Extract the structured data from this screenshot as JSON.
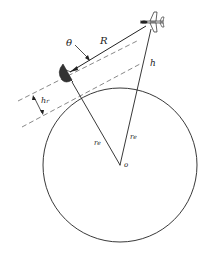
{
  "diagram": {
    "type": "geometry",
    "labels": {
      "theta": "θ",
      "range": "R",
      "height": "h",
      "radar_height_main": "h",
      "radar_height_sub": "r",
      "earth_radius_left_main": "r",
      "earth_radius_left_sub": "e",
      "earth_radius_right_main": "r",
      "earth_radius_right_sub": "e",
      "center": "o"
    },
    "elements": {
      "earth_circle": {
        "cx": 120,
        "cy": 165,
        "r": 76
      },
      "radar_dish": {
        "x": 66,
        "y": 74
      },
      "aircraft": {
        "x": 152,
        "y": 22
      }
    },
    "colors": {
      "stroke": "#222222",
      "dashed": "#555555",
      "background": "#ffffff"
    }
  }
}
